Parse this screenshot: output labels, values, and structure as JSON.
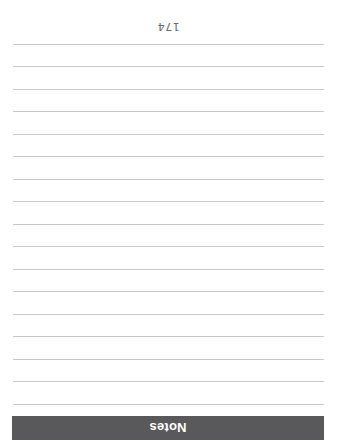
{
  "document": {
    "page_number": "174",
    "background_color": "#ffffff",
    "orientation": "rotated-180",
    "width": 337,
    "height": 442
  },
  "section_header": {
    "title": "Notes",
    "background_color": "#59595b",
    "text_color": "#ffffff"
  },
  "ruled_lines": {
    "count": 17,
    "color": "#c9c9cb",
    "left": 13,
    "width": 311,
    "first_top": 37,
    "spacing": 22.5,
    "tops": [
      37,
      59.5,
      82,
      104.5,
      127,
      149.5,
      172,
      194.5,
      217,
      239.5,
      262,
      284.5,
      307,
      329.5,
      352,
      374.5,
      397
    ]
  }
}
